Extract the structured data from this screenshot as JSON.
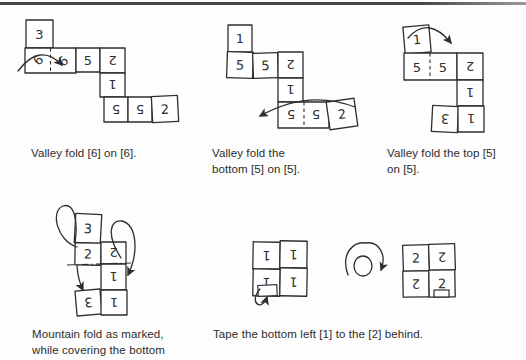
{
  "style": {
    "ink": "#2e2e2e",
    "paper": "#ffffff",
    "page_bg": "#fdfdfd",
    "rule_color": "#454545"
  },
  "captions": {
    "step1": "Valley fold [6] on [6].",
    "step2": "Valley fold the\nbottom [5] on [5].",
    "step3": "Valley fold the top [5]\non [5].",
    "step4": "Mountain fold as marked,\nwhile covering the bottom",
    "step56": "Tape the bottom left [1] to the [2] behind."
  },
  "panels": [
    {
      "id": "step1",
      "box": {
        "x": 15,
        "y": 10,
        "w": 195,
        "h": 130
      },
      "cells": [
        {
          "x": 11,
          "y": 10,
          "w": 27,
          "h": 28,
          "label": "3"
        },
        {
          "x": 10,
          "y": 38,
          "w": 51,
          "h": 25,
          "label": ""
        },
        {
          "x": 23,
          "y": 50,
          "label": "6",
          "rot": -45,
          "point": true
        },
        {
          "x": 48,
          "y": 51,
          "label": "6",
          "rot": -45,
          "point": true
        },
        {
          "x": 61,
          "y": 38,
          "w": 24,
          "h": 24,
          "label": "5"
        },
        {
          "x": 85,
          "y": 38,
          "w": 25,
          "h": 25,
          "label": "2",
          "rot": 180
        },
        {
          "x": 85,
          "y": 63,
          "w": 25,
          "h": 24,
          "label": "1",
          "rot": 180
        },
        {
          "x": 89,
          "y": 87,
          "w": 24,
          "h": 25,
          "label": "5",
          "rot": 180
        },
        {
          "x": 113,
          "y": 87,
          "w": 24,
          "h": 25,
          "label": "5",
          "rot": 180
        },
        {
          "x": 137,
          "y": 86,
          "w": 26,
          "h": 26,
          "label": "2",
          "tilt": -3
        }
      ],
      "foldlines": [
        {
          "x1": 35.5,
          "y1": 38,
          "x2": 35.5,
          "y2": 63,
          "dash": "3.5 3"
        }
      ],
      "paths": [
        {
          "d": "M 3,61 Q 25,32 47,55",
          "head": true
        }
      ]
    },
    {
      "id": "step2",
      "box": {
        "x": 220,
        "y": 15,
        "w": 160,
        "h": 130
      },
      "cells": [
        {
          "x": 8,
          "y": 10,
          "w": 24,
          "h": 27,
          "label": "1"
        },
        {
          "x": 7,
          "y": 37,
          "w": 26,
          "h": 26,
          "label": "5",
          "tilt": 2
        },
        {
          "x": 33,
          "y": 38,
          "w": 25,
          "h": 25,
          "label": "5",
          "tilt": -2
        },
        {
          "x": 58,
          "y": 37,
          "w": 25,
          "h": 26,
          "label": "2",
          "rot": 180
        },
        {
          "x": 58,
          "y": 63,
          "w": 25,
          "h": 24,
          "label": "1",
          "rot": 180
        },
        {
          "x": 58,
          "y": 87,
          "w": 51,
          "h": 26,
          "label": ""
        },
        {
          "x": 71,
          "y": 100,
          "label": "5",
          "rot": 180,
          "point": true
        },
        {
          "x": 96,
          "y": 100,
          "label": "5",
          "rot": 180,
          "point": true
        },
        {
          "x": 108,
          "y": 85,
          "w": 28,
          "h": 28,
          "label": "2",
          "tilt": -8
        }
      ],
      "foldlines": [
        {
          "x1": 84,
          "y1": 87,
          "x2": 84,
          "y2": 113,
          "dash": "3.5 3"
        }
      ],
      "paths": [
        {
          "d": "M 135,92 Q 88,74 40,101",
          "head": true
        }
      ]
    },
    {
      "id": "step3",
      "box": {
        "x": 395,
        "y": 12,
        "w": 125,
        "h": 135
      },
      "cells": [
        {
          "x": 9,
          "y": 14,
          "w": 26,
          "h": 27,
          "label": "1",
          "tilt": -5
        },
        {
          "x": 9,
          "y": 41,
          "w": 53,
          "h": 27,
          "label": ""
        },
        {
          "x": 22,
          "y": 55,
          "label": "5",
          "point": true
        },
        {
          "x": 48,
          "y": 55,
          "label": "5",
          "point": true
        },
        {
          "x": 62,
          "y": 41,
          "w": 26,
          "h": 27,
          "label": "2",
          "rot": 180
        },
        {
          "x": 62,
          "y": 68,
          "w": 26,
          "h": 26,
          "label": "1",
          "rot": 180
        },
        {
          "x": 37,
          "y": 94,
          "w": 26,
          "h": 26,
          "label": "3",
          "rot": 180,
          "tilt": 3
        },
        {
          "x": 63,
          "y": 94,
          "w": 26,
          "h": 26,
          "label": "1",
          "rot": 180
        }
      ],
      "foldlines": [
        {
          "x1": 35,
          "y1": 41,
          "x2": 35,
          "y2": 68,
          "dash": "3.5 3"
        }
      ],
      "paths": [
        {
          "d": "M 13,26 Q 33,3 56,31",
          "head": true
        }
      ]
    },
    {
      "id": "step4",
      "box": {
        "x": 45,
        "y": 195,
        "w": 130,
        "h": 125
      },
      "cells": [
        {
          "x": 30,
          "y": 19,
          "w": 26,
          "h": 29,
          "label": "3",
          "tilt": 3
        },
        {
          "x": 30,
          "y": 48,
          "w": 26,
          "h": 22,
          "label": "2",
          "tilt": 1
        },
        {
          "x": 56,
          "y": 47,
          "w": 25,
          "h": 22,
          "label": "2",
          "rot": 180
        },
        {
          "x": 56,
          "y": 69,
          "w": 25,
          "h": 26,
          "label": "1",
          "rot": 180
        },
        {
          "x": 31,
          "y": 95,
          "w": 25,
          "h": 25,
          "label": "3",
          "rot": 180,
          "tilt": -5
        },
        {
          "x": 56,
          "y": 95,
          "w": 26,
          "h": 25,
          "label": "1",
          "rot": 180
        }
      ],
      "foldlines": [
        {
          "x1": 22,
          "y1": 70,
          "x2": 86,
          "y2": 68,
          "dash": "7 3 1.5 3"
        }
      ],
      "paths": [
        {
          "d": "M 32,52 C 12,46 5,16 18,11 C 30,7 33,28 30,48",
          "head": false,
          "name": "mountain-fold-loop-left"
        },
        {
          "d": "M 32,71 Q 33,85 38,95",
          "head": true
        },
        {
          "d": "M 76,63 C 61,40 65,24 77,26 C 92,30 94,57 83,80",
          "head": true,
          "name": "mountain-fold-loop-right"
        }
      ]
    },
    {
      "id": "step5",
      "box": {
        "x": 245,
        "y": 228,
        "w": 150,
        "h": 85
      },
      "cells": [
        {
          "x": 8,
          "y": 14,
          "w": 27,
          "h": 27,
          "label": "1",
          "rot": 180,
          "tilt": 1
        },
        {
          "x": 35,
          "y": 13,
          "w": 27,
          "h": 27,
          "label": "1",
          "rot": 180,
          "tilt": 1
        },
        {
          "x": 8,
          "y": 41,
          "w": 27,
          "h": 27,
          "label": "1",
          "rot": 180,
          "tilt": 1
        },
        {
          "x": 35,
          "y": 40,
          "w": 27,
          "h": 28,
          "label": "1",
          "rot": 180,
          "tilt": 1
        }
      ],
      "tapes": [
        {
          "x": 13,
          "y": 57,
          "w": 19,
          "h": 11,
          "tilt": -3
        }
      ],
      "ellipses": [
        {
          "cx": 118,
          "cy": 38,
          "rx": 9,
          "ry": 10
        }
      ],
      "paths": [
        {
          "d": "M 15,61 C 3,75 17,84 22,69",
          "head": true,
          "name": "tape-loop-arrow"
        },
        {
          "d": "M 103,47 C 95,25 109,13 121,15 C 134,13 142,27 136,42",
          "head": true,
          "name": "flip-over-arrow"
        }
      ]
    },
    {
      "id": "step6",
      "box": {
        "x": 398,
        "y": 236,
        "w": 75,
        "h": 72
      },
      "cells": [
        {
          "x": 5,
          "y": 9,
          "w": 26,
          "h": 26,
          "label": "2",
          "tilt": -2
        },
        {
          "x": 31,
          "y": 8,
          "w": 26,
          "h": 26,
          "label": "2",
          "rot": 180,
          "tilt": -2
        },
        {
          "x": 5,
          "y": 35,
          "w": 26,
          "h": 26,
          "label": "2",
          "rot": 180,
          "tilt": -1
        },
        {
          "x": 31,
          "y": 34,
          "w": 26,
          "h": 27,
          "label": "2",
          "tilt": -1
        }
      ],
      "tapes": [
        {
          "x": 36,
          "y": 54,
          "w": 15,
          "h": 7
        }
      ]
    }
  ]
}
